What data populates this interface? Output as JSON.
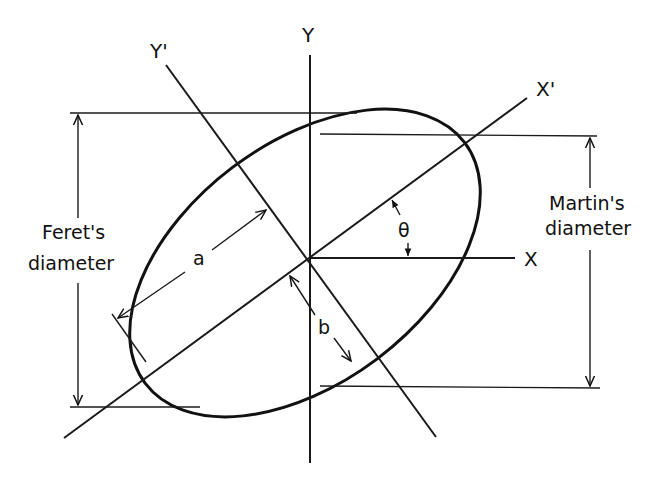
{
  "figure": {
    "type": "geometric-diagram"
  },
  "labels": {
    "y_axis": "Y",
    "y_prime_axis": "Y'",
    "x_axis": "X",
    "x_prime_axis": "X'",
    "semi_major": "a",
    "semi_minor": "b",
    "angle": "θ",
    "feret_line1": "Feret's",
    "feret_line2": "diameter",
    "martin_line1": "Martin's",
    "martin_line2": "diameter"
  },
  "colors": {
    "stroke": "#111111",
    "background": "#ffffff"
  }
}
